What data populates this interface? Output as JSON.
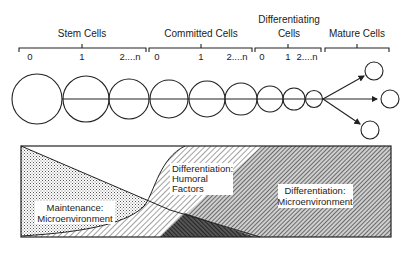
{
  "stages": [
    {
      "label": "Stem Cells",
      "label_lines": [
        "Stem Cells"
      ],
      "ticks": [
        "0",
        "1",
        "2....n"
      ]
    },
    {
      "label": "Committed Cells",
      "label_lines": [
        "Committed Cells"
      ],
      "ticks": [
        "0",
        "1",
        "2....n"
      ]
    },
    {
      "label": "Differentiating Cells",
      "label_lines": [
        "Differentiating",
        "Cells"
      ],
      "ticks": [
        "0",
        "1",
        "2....n"
      ]
    },
    {
      "label": "Mature Cells",
      "label_lines": [
        "Mature Cells"
      ],
      "ticks": []
    }
  ],
  "cell_lineage": {
    "progression_circles": 9,
    "mature_outputs": 3
  },
  "regulation_zones": [
    {
      "name": "maintenance",
      "label_lines": [
        "Maintenance:",
        "Microenvironment"
      ],
      "pattern": "fine dots"
    },
    {
      "name": "differentiation-humoral",
      "label_lines": [
        "Differentiation:",
        "Humoral",
        "Factors"
      ],
      "pattern": "light diagonal hatch"
    },
    {
      "name": "differentiation-microenvironment",
      "label_lines": [
        "Differentiation:",
        "Microenvironment"
      ],
      "pattern": "dense diagonal hatch"
    }
  ],
  "colors": {
    "ink": "#222222",
    "background": "#ffffff"
  }
}
